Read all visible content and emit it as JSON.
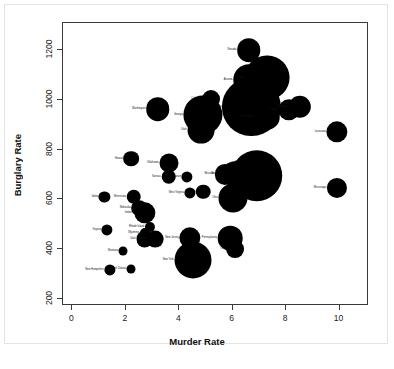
{
  "figure": {
    "background_color": "#ffffff",
    "frame_color": "#e3e3e3",
    "axis_color": "#3a3a3a",
    "bubble_color": "#000000"
  },
  "axes": {
    "x_title": "Murder Rate",
    "y_title": "Burglary Rate",
    "x_ticks": [
      "0",
      "2",
      "4",
      "6",
      "8",
      "10"
    ],
    "y_ticks": [
      "200",
      "400",
      "600",
      "800",
      "1000",
      "1200"
    ]
  },
  "chart_data": {
    "type": "scatter",
    "title": "",
    "xlabel": "Murder Rate",
    "ylabel": "Burglary Rate",
    "xlim": [
      -0.35,
      11.1
    ],
    "ylim": [
      170,
      1310
    ],
    "grid": false,
    "legend": false,
    "bubble_encoding": "circle area proportional to state population",
    "point_label_position": "left of marker",
    "points": [
      {
        "label": "Nevada",
        "x": 6.6,
        "y": 1201,
        "size": 2.1
      },
      {
        "label": "Arizona",
        "x": 6.6,
        "y": 1082,
        "size": 2.8
      },
      {
        "label": "Florida",
        "x": 7.3,
        "y": 1090,
        "size": 4.0
      },
      {
        "label": "Texas",
        "x": 7.1,
        "y": 1030,
        "size": 2.5
      },
      {
        "label": "California",
        "x": 6.7,
        "y": 972,
        "size": 5.2
      },
      {
        "label": "Colorado",
        "x": 5.2,
        "y": 1003,
        "size": 1.6
      },
      {
        "label": "Georgia",
        "x": 4.9,
        "y": 940,
        "size": 3.5
      },
      {
        "label": "Utah",
        "x": 4.8,
        "y": 880,
        "size": 2.4
      },
      {
        "label": "Washington",
        "x": 3.2,
        "y": 962,
        "size": 2.1
      },
      {
        "label": "New Mexico",
        "x": 7.3,
        "y": 930,
        "size": 2.2
      },
      {
        "label": "Oregon",
        "x": 8.1,
        "y": 960,
        "size": 1.9
      },
      {
        "label": "Michigan",
        "x": 8.5,
        "y": 972,
        "size": 2.0
      },
      {
        "label": "Louisiana",
        "x": 9.9,
        "y": 872,
        "size": 1.9
      },
      {
        "label": "Mississippi",
        "x": 9.9,
        "y": 645,
        "size": 1.8
      },
      {
        "label": "Alabama",
        "x": 6.9,
        "y": 745,
        "size": 2.0
      },
      {
        "label": "Illinois",
        "x": 6.9,
        "y": 695,
        "size": 4.6
      },
      {
        "label": "Maryland",
        "x": 6.1,
        "y": 700,
        "size": 2.3
      },
      {
        "label": "Missouri",
        "x": 5.7,
        "y": 700,
        "size": 1.8
      },
      {
        "label": "Ohio",
        "x": 6.0,
        "y": 604,
        "size": 2.6
      },
      {
        "label": "Oklahoma",
        "x": 3.6,
        "y": 748,
        "size": 1.7
      },
      {
        "label": "Kansas",
        "x": 3.6,
        "y": 691,
        "size": 1.3
      },
      {
        "label": "Delaware",
        "x": 4.3,
        "y": 690,
        "size": 1.0
      },
      {
        "label": "Hawaii",
        "x": 2.2,
        "y": 763,
        "size": 1.4
      },
      {
        "label": "Alaska",
        "x": 4.9,
        "y": 630,
        "size": 1.3
      },
      {
        "label": "West Virginia",
        "x": 4.4,
        "y": 624,
        "size": 1.0
      },
      {
        "label": "Idaho",
        "x": 1.2,
        "y": 608,
        "size": 1.0
      },
      {
        "label": "Minnesota",
        "x": 2.3,
        "y": 610,
        "size": 1.3
      },
      {
        "label": "Nebraska",
        "x": 2.5,
        "y": 563,
        "size": 1.4
      },
      {
        "label": "Indiana",
        "x": 2.7,
        "y": 546,
        "size": 1.9
      },
      {
        "label": "Rhode Island",
        "x": 2.9,
        "y": 489,
        "size": 0.9
      },
      {
        "label": "Virginia",
        "x": 1.3,
        "y": 478,
        "size": 1.0
      },
      {
        "label": "Wyoming",
        "x": 2.7,
        "y": 465,
        "size": 0.9
      },
      {
        "label": "Utah (2)",
        "x": 2.7,
        "y": 441,
        "size": 1.5
      },
      {
        "label": "Iowa",
        "x": 3.1,
        "y": 441,
        "size": 1.5
      },
      {
        "label": "New Jersey",
        "x": 4.4,
        "y": 445,
        "size": 1.9
      },
      {
        "label": "Pennsylvania",
        "x": 5.9,
        "y": 444,
        "size": 2.2
      },
      {
        "label": "Ohio (2)",
        "x": 6.1,
        "y": 398,
        "size": 1.6
      },
      {
        "label": "Montana",
        "x": 1.9,
        "y": 392,
        "size": 0.8
      },
      {
        "label": "New York",
        "x": 4.5,
        "y": 356,
        "size": 3.3
      },
      {
        "label": "New Hampshire",
        "x": 1.4,
        "y": 316,
        "size": 1.0
      },
      {
        "label": "South Dakota",
        "x": 2.2,
        "y": 320,
        "size": 0.8
      }
    ]
  }
}
